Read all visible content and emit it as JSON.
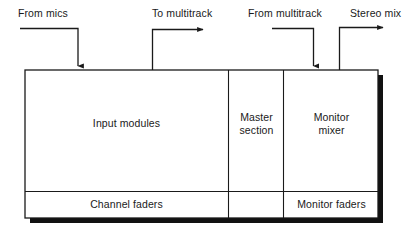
{
  "diagram": {
    "colors": {
      "line": "#1a1a1a",
      "shadow": "#111111",
      "background": "#ffffff"
    },
    "flows": [
      {
        "id": "from-mics",
        "label": "From mics",
        "direction": "into-console"
      },
      {
        "id": "to-multitrack",
        "label": "To multitrack",
        "direction": "out-of-console"
      },
      {
        "id": "from-multitrack",
        "label": "From multitrack",
        "direction": "into-console"
      },
      {
        "id": "stereo-mix",
        "label": "Stereo mix",
        "direction": "out-of-console"
      }
    ],
    "console": {
      "upper_row": [
        {
          "id": "input-modules",
          "label": "Input modules"
        },
        {
          "id": "master-section",
          "label": "Master\nsection"
        },
        {
          "id": "monitor-mixer",
          "label": "Monitor\nmixer"
        }
      ],
      "lower_row": [
        {
          "id": "channel-faders",
          "label": "Channel faders"
        },
        {
          "id": "master-blank",
          "label": ""
        },
        {
          "id": "monitor-faders",
          "label": "Monitor faders"
        }
      ]
    }
  }
}
